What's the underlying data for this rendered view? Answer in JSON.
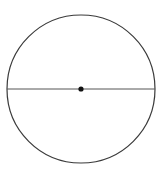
{
  "diagram": {
    "type": "circle-with-diameter",
    "circle": {
      "cx": 81,
      "cy": 89,
      "r": 74,
      "stroke": "#3a3a3a",
      "stroke_width": 1.2,
      "fill": "none"
    },
    "diameter": {
      "x1": 7,
      "y1": 89,
      "x2": 155,
      "y2": 89,
      "stroke": "#555555",
      "stroke_width": 1
    },
    "center_point": {
      "cx": 81,
      "cy": 89,
      "r": 2.6,
      "fill": "#111111"
    }
  }
}
